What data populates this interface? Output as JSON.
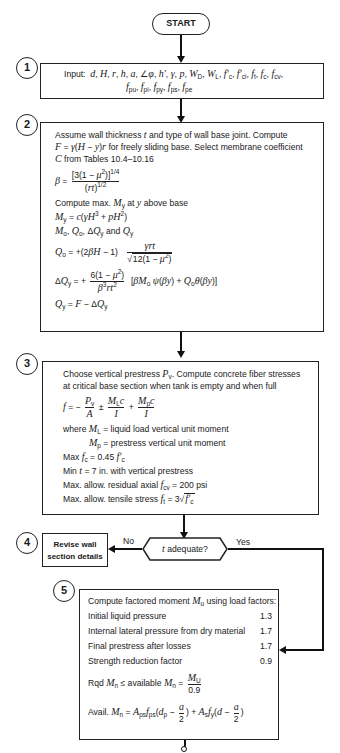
{
  "start": {
    "label": "START"
  },
  "step1": {
    "number": "1",
    "prefix": "Input:",
    "line1": "d, H, r, h, a, ∠φ, h′, γ, p, W_D, W_L, f′_c, f′_ci, f_t, f_c, f_cv,",
    "line2": "f_pu, f_pi, f_py, f_ps, f_pe"
  },
  "step2": {
    "number": "2",
    "intro_line1": "Assume wall thickness t and type of wall base joint. Compute",
    "intro_line2": "F = γ(H − y)r for freely sliding base. Select membrane coefficient",
    "intro_line3": "C from Tables 10.4–10.16",
    "beta_lhs": "β =",
    "beta_num": "[3(1 − μ²)]^1/4",
    "beta_den": "(rt)^1/2",
    "compute_line": "Compute max. M_y at y above base",
    "my_formula": "M_y = c(γH³ + pH²)",
    "mo_line": "M_o, Q_o, ΔQ_y and Q_y",
    "qo_lhs": "Q_o = +(2βH − 1)",
    "qo_num": "γrt",
    "qo_den": "12(1 − μ²)",
    "dq_lhs": "ΔQ_y = +",
    "dq_num": "6(1 − μ²)",
    "dq_den": "β³rt²",
    "dq_rhs": "[βM_o ψ(βy) + Q_o θ(βy)]",
    "qy_formula": "Q_y = F − ΔQ_y"
  },
  "step3": {
    "number": "3",
    "intro_line1": "Choose vertical prestress P_v. Compute concrete fiber stresses",
    "intro_line2": "at critical base section when tank is empty and when full",
    "f_lhs": "f = −",
    "f_t1_num": "P_v",
    "f_t1_den": "A",
    "f_op1": "±",
    "f_t2_num": "M_L c",
    "f_t2_den": "I",
    "f_op2": "+",
    "f_t3_num": "M_p c",
    "f_t3_den": "I",
    "where_line": "where M_L = liquid load vertical unit moment",
    "mp_line": "M_p = prestress vertical unit moment",
    "max_fc": "Max f_c = 0.45 f′_c",
    "min_t": "Min t = 7 in. with vertical prestress",
    "max_residual": "Max. allow. residual axial f_cv = 200 psi",
    "max_tensile": "Max. allow. tensile stress f_t = 3√f′_c"
  },
  "step4": {
    "number": "4",
    "decision": "t adequate?",
    "no_label": "No",
    "yes_label": "Yes",
    "revise_line1": "Revise wall",
    "revise_line2": "section details"
  },
  "step5": {
    "number": "5",
    "intro": "Compute factored moment M_u using load factors:",
    "factors": [
      {
        "label": "Initial liquid pressure",
        "value": "1.3"
      },
      {
        "label": "Internal lateral pressure from dry material",
        "value": "1.7"
      },
      {
        "label": "Final prestress after losses",
        "value": "1.7"
      },
      {
        "label": "Strength reduction factor",
        "value": "0.9"
      }
    ],
    "rqd_lhs": "Rqd M_n ≤ available M_n =",
    "rqd_num": "M_U",
    "rqd_den": "0.9",
    "avail_line": "Avail. M_n = A_ps f_ps (d_p − a/2) + A_s f_y (d − a/2)"
  },
  "colors": {
    "line": "#111111",
    "background": "#ffffff"
  }
}
